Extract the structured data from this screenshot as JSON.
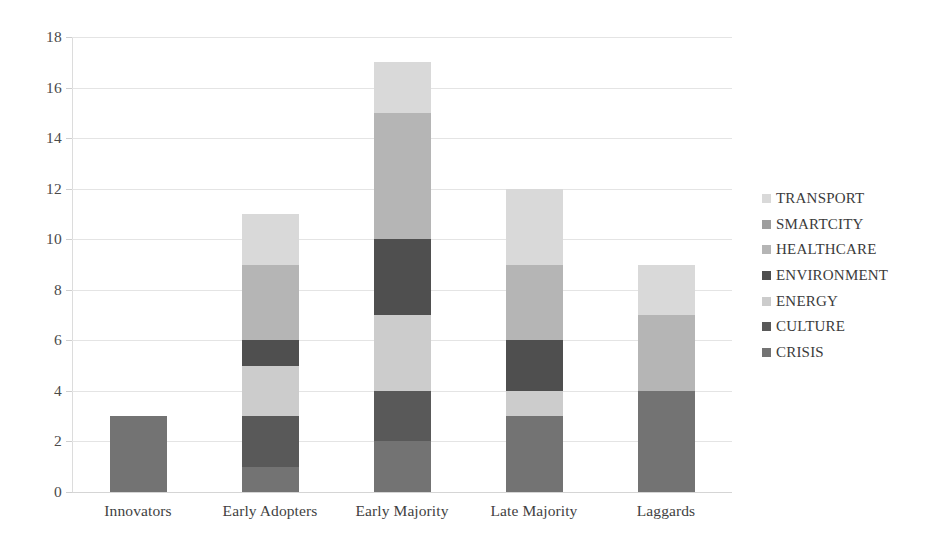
{
  "chart_data": {
    "type": "bar",
    "stacked": true,
    "title": "",
    "xlabel": "",
    "ylabel": "",
    "ylim": [
      0,
      18
    ],
    "ytick_step": 2,
    "yticks": [
      "18",
      "16",
      "14",
      "12",
      "10",
      "8",
      "6",
      "4",
      "2",
      "0"
    ],
    "grid": true,
    "legend_position": "right",
    "categories": [
      "Innovators",
      "Early Adopters",
      "Early Majority",
      "Late Majority",
      "Laggards"
    ],
    "series": [
      {
        "name": "CRISIS",
        "color": "#737373",
        "values": [
          3,
          1,
          2,
          3,
          4
        ]
      },
      {
        "name": "CULTURE",
        "color": "#595959",
        "values": [
          0,
          2,
          2,
          0,
          0
        ]
      },
      {
        "name": "ENERGY",
        "color": "#cccccc",
        "values": [
          0,
          2,
          3,
          1,
          0
        ]
      },
      {
        "name": "ENVIRONMENT",
        "color": "#4f4f4f",
        "values": [
          0,
          1,
          3,
          2,
          0
        ]
      },
      {
        "name": "HEALTHCARE",
        "color": "#b5b5b5",
        "values": [
          0,
          3,
          5,
          3,
          3
        ]
      },
      {
        "name": "SMARTCITY",
        "color": "#9e9e9e",
        "values": [
          0,
          0,
          0,
          0,
          0
        ]
      },
      {
        "name": "TRANSPORT",
        "color": "#d9d9d9",
        "values": [
          0,
          2,
          2,
          3,
          2
        ]
      }
    ],
    "totals": [
      3,
      11,
      17,
      12,
      9
    ]
  },
  "legend": {
    "items": [
      {
        "label": "TRANSPORT",
        "color": "#d9d9d9"
      },
      {
        "label": "SMARTCITY",
        "color": "#9e9e9e"
      },
      {
        "label": "HEALTHCARE",
        "color": "#b5b5b5"
      },
      {
        "label": "ENVIRONMENT",
        "color": "#4f4f4f"
      },
      {
        "label": "ENERGY",
        "color": "#cccccc"
      },
      {
        "label": "CULTURE",
        "color": "#595959"
      },
      {
        "label": "CRISIS",
        "color": "#737373"
      }
    ]
  },
  "axes": {
    "y_tick_labels": [
      "18",
      "16",
      "14",
      "12",
      "10",
      "8",
      "6",
      "4",
      "2",
      "0"
    ],
    "x_tick_labels": [
      "Innovators",
      "Early Adopters",
      "Early Majority",
      "Late Majority",
      "Laggards"
    ]
  }
}
